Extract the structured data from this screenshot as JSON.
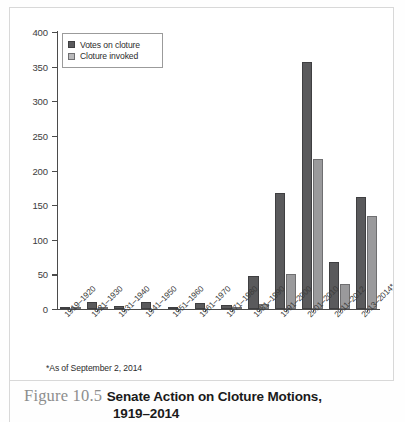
{
  "caption": {
    "figure_number": "Figure 10.5",
    "title_line1": "Senate Action on Cloture Motions,",
    "title_line2": "1919–2014"
  },
  "footnote": "*As of September 2, 2014",
  "legend": {
    "items": [
      {
        "label": "Votes on cloture",
        "color": "#5a5a5c"
      },
      {
        "label": "Cloture invoked",
        "color": "#9a9a9c"
      }
    ]
  },
  "chart_data": {
    "type": "bar",
    "xlabel": "",
    "ylabel": "",
    "ylim": [
      0,
      400
    ],
    "yticks": [
      0,
      50,
      100,
      150,
      200,
      250,
      300,
      350,
      400
    ],
    "ytick_labels": [
      "0",
      "50",
      "100",
      "150",
      "200",
      "250",
      "300",
      "350",
      "400"
    ],
    "grid": false,
    "legend_position": "upper left",
    "categories": [
      "1919–1920",
      "1921–1930",
      "1931–1940",
      "1941–1950",
      "1951–1960",
      "1961–1970",
      "1971–1980",
      "1981–1990",
      "1991–2000",
      "2001–2010",
      "2011–2012",
      "2013–2014*"
    ],
    "series": [
      {
        "name": "Votes on cloture",
        "color": "#5a5a5c",
        "values": [
          3,
          10,
          4,
          10,
          3,
          9,
          6,
          47,
          168,
          356,
          68,
          162
        ]
      },
      {
        "name": "Cloture invoked",
        "color": "#9a9a9c",
        "values": [
          1,
          3,
          0,
          0,
          0,
          0,
          1,
          7,
          50,
          217,
          36,
          135
        ]
      }
    ],
    "annotations": [
      "*As of September 2, 2014"
    ]
  }
}
